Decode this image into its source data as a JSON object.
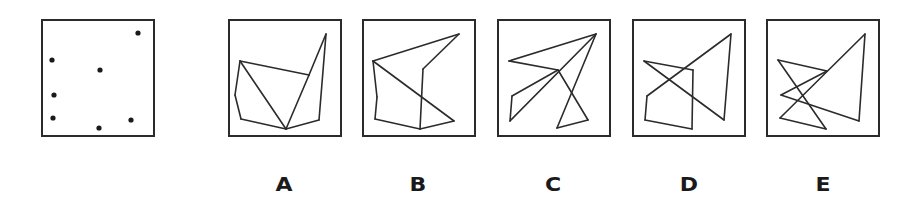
{
  "puzzle": {
    "type": "dot-pattern matching",
    "question_figure": {
      "name": "reference-dots",
      "dots": [
        [
          95,
          12
        ],
        [
          9,
          39
        ],
        [
          57,
          49
        ],
        [
          11,
          74
        ],
        [
          10,
          97
        ],
        [
          56,
          107
        ],
        [
          88,
          99
        ]
      ]
    },
    "options": [
      {
        "label": "A",
        "points": {
          "P1": [
            96,
            13
          ],
          "P2": [
            10,
            40
          ],
          "P3": [
            79,
            54
          ],
          "P4": [
            5,
            74
          ],
          "P5": [
            11,
            98
          ],
          "P6": [
            56,
            108
          ],
          "P7": [
            89,
            99
          ]
        },
        "segments": [
          [
            "P2",
            "P3"
          ],
          [
            "P3",
            "P1"
          ],
          [
            "P1",
            "P7"
          ],
          [
            "P7",
            "P6"
          ],
          [
            "P6",
            "P2"
          ],
          [
            "P2",
            "P4"
          ],
          [
            "P4",
            "P5"
          ],
          [
            "P5",
            "P6"
          ],
          [
            "P6",
            "P3"
          ]
        ]
      },
      {
        "label": "B",
        "points": {
          "P1": [
            95,
            13
          ],
          "P2": [
            9,
            40
          ],
          "P3": [
            59,
            48
          ],
          "P4": [
            13,
            76
          ],
          "P5": [
            11,
            98
          ],
          "P6": [
            56,
            108
          ],
          "P7": [
            90,
            100
          ]
        },
        "segments": [
          [
            "P2",
            "P1"
          ],
          [
            "P1",
            "P3"
          ],
          [
            "P3",
            "P6"
          ],
          [
            "P2",
            "P7"
          ],
          [
            "P7",
            "P6"
          ],
          [
            "P6",
            "P5"
          ],
          [
            "P5",
            "P4"
          ],
          [
            "P4",
            "P2"
          ]
        ]
      },
      {
        "label": "C",
        "points": {
          "P1": [
            97,
            13
          ],
          "P2": [
            10,
            40
          ],
          "P3": [
            59,
            49
          ],
          "P4": [
            13,
            75
          ],
          "P5": [
            11,
            100
          ],
          "P6": [
            58,
            107
          ],
          "P7": [
            89,
            99
          ]
        },
        "segments": [
          [
            "P2",
            "P1"
          ],
          [
            "P2",
            "P3"
          ],
          [
            "P3",
            "P4"
          ],
          [
            "P4",
            "P5"
          ],
          [
            "P5",
            "P1"
          ],
          [
            "P3",
            "P7"
          ],
          [
            "P7",
            "P6"
          ],
          [
            "P6",
            "P1"
          ]
        ]
      },
      {
        "label": "D",
        "points": {
          "P1": [
            97,
            13
          ],
          "P2": [
            10,
            40
          ],
          "P3": [
            59,
            49
          ],
          "P4": [
            13,
            75
          ],
          "P5": [
            11,
            99
          ],
          "P6": [
            58,
            108
          ],
          "P7": [
            90,
            99
          ]
        },
        "segments": [
          [
            "P2",
            "P3"
          ],
          [
            "P2",
            "P7"
          ],
          [
            "P7",
            "P1"
          ],
          [
            "P1",
            "P4"
          ],
          [
            "P4",
            "P5"
          ],
          [
            "P5",
            "P6"
          ],
          [
            "P6",
            "P3"
          ]
        ]
      },
      {
        "label": "E",
        "points": {
          "P1": [
            97,
            13
          ],
          "P2": [
            10,
            39
          ],
          "P3": [
            59,
            50
          ],
          "P4": [
            13,
            74
          ],
          "P5": [
            12,
            97
          ],
          "P6": [
            58,
            108
          ],
          "P7": [
            91,
            100
          ]
        },
        "segments": [
          [
            "P2",
            "P3"
          ],
          [
            "P3",
            "P4"
          ],
          [
            "P4",
            "P7"
          ],
          [
            "P7",
            "P1"
          ],
          [
            "P1",
            "P5"
          ],
          [
            "P5",
            "P6"
          ],
          [
            "P6",
            "P2"
          ]
        ]
      }
    ],
    "colors": {
      "line": "#2b2b2b",
      "border": "#2b2b2b",
      "background": "#ffffff",
      "label": "#1a1a1a"
    }
  }
}
